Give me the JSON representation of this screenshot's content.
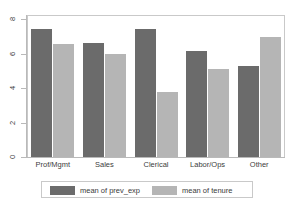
{
  "chart_data": {
    "type": "bar",
    "title": "",
    "subtitle": "",
    "xlabel": "",
    "ylabel": "",
    "categories": [
      "Prof/Mgmt",
      "Sales",
      "Clerical",
      "Labor/Ops",
      "Other"
    ],
    "series": [
      {
        "name": "mean of prev_exp",
        "color": "#6b6b6b",
        "values": [
          7.45,
          6.6,
          7.4,
          6.15,
          5.3
        ]
      },
      {
        "name": "mean of tenure",
        "color": "#b5b5b5",
        "values": [
          6.55,
          6.0,
          3.75,
          5.1,
          6.95
        ]
      }
    ],
    "ylim": [
      0,
      8
    ],
    "yticks": [
      0,
      2,
      4,
      6,
      8
    ],
    "ytick_labels": [
      "0",
      "2",
      "4",
      "6",
      "8"
    ],
    "grid": false,
    "legend_position": "bottom",
    "frame_color": "#c9c9c9",
    "axis_color": "#b9b9b9",
    "background": "#ffffff"
  },
  "legend": {
    "entries": [
      {
        "label": "mean of prev_exp",
        "color": "#6b6b6b"
      },
      {
        "label": "mean of tenure",
        "color": "#b5b5b5"
      }
    ]
  }
}
